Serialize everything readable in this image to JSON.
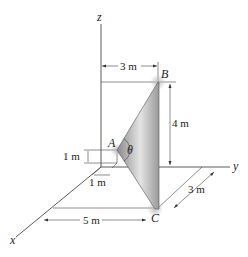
{
  "figure": {
    "type": "3D statics diagram",
    "axes": {
      "x": "x",
      "y": "y",
      "z": "z"
    },
    "points": {
      "A": "A",
      "B": "B",
      "C": "C"
    },
    "angle": "θ",
    "dimensions": {
      "top_width": "3 m",
      "height_B": "4 m",
      "A_height": "1 m",
      "A_offset": "1 m",
      "x_distance": "5 m",
      "y_distance": "3 m"
    },
    "colors": {
      "plate_dark": "#6e6e6e",
      "plate_light": "#e0e0e0",
      "line": "#333333"
    }
  }
}
